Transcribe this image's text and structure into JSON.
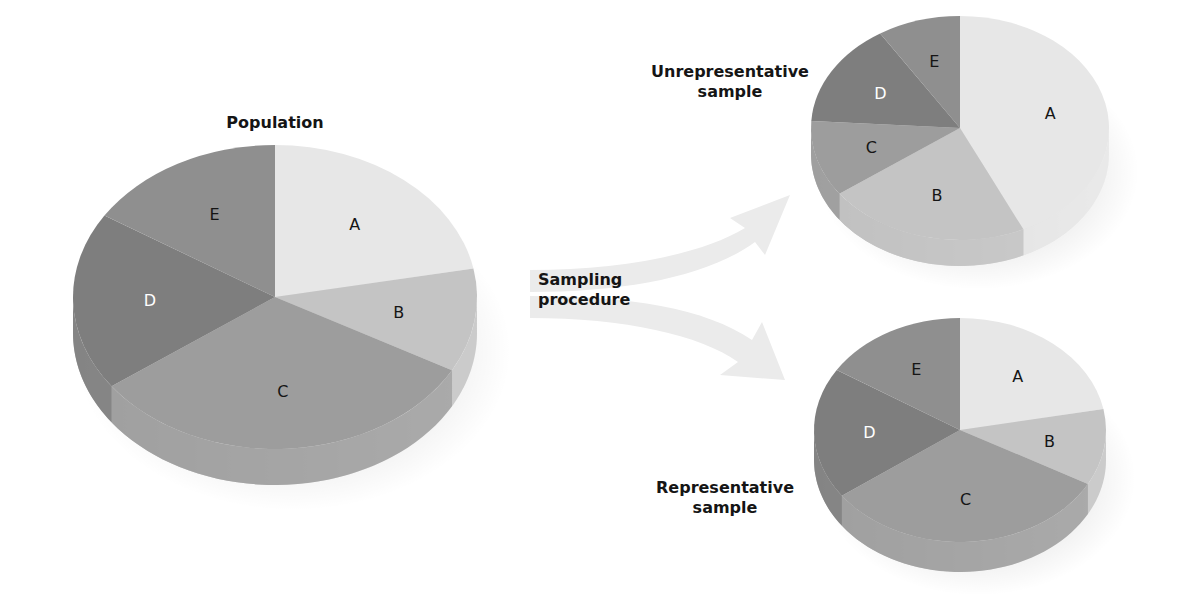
{
  "labels": {
    "population": "Population",
    "sampling_line1": "Sampling",
    "sampling_line2": "procedure",
    "unrep_line1": "Unrepresentative",
    "unrep_line2": "sample",
    "rep_line1": "Representative",
    "rep_line2": "sample"
  },
  "colors": {
    "A": "#e7e7e7",
    "B": "#c4c4c4",
    "C": "#9d9d9d",
    "D": "#7e7e7e",
    "E": "#8f8f8f",
    "arrow": "#ebebeb",
    "text": "#151515"
  },
  "pies": {
    "population": {
      "title": "Population",
      "slices": [
        {
          "label": "A",
          "share": 22
        },
        {
          "label": "B",
          "share": 11
        },
        {
          "label": "C",
          "share": 32
        },
        {
          "label": "D",
          "share": 19
        },
        {
          "label": "E",
          "share": 16
        }
      ]
    },
    "unrepresentative": {
      "title": "Unrepresentative sample",
      "slices": [
        {
          "label": "A",
          "share": 43
        },
        {
          "label": "B",
          "share": 22
        },
        {
          "label": "C",
          "share": 11
        },
        {
          "label": "D",
          "share": 15
        },
        {
          "label": "E",
          "share": 9
        }
      ]
    },
    "representative": {
      "title": "Representative sample",
      "slices": [
        {
          "label": "A",
          "share": 22
        },
        {
          "label": "B",
          "share": 11
        },
        {
          "label": "C",
          "share": 32
        },
        {
          "label": "D",
          "share": 19
        },
        {
          "label": "E",
          "share": 16
        }
      ]
    }
  }
}
